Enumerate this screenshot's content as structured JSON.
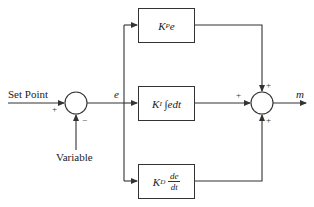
{
  "diagram": {
    "type": "PID controller block diagram",
    "inputs": {
      "set_point_label": "Set Point",
      "variable_label": "Variable"
    },
    "summing_junction_1": {
      "plus_sign": "+",
      "minus_sign": "−"
    },
    "error_label": "e",
    "blocks": [
      {
        "id": "proportional",
        "gain": "K",
        "subscript": "P",
        "expression": "e"
      },
      {
        "id": "integral",
        "gain": "K",
        "subscript": "I",
        "expression": "∫edt"
      },
      {
        "id": "derivative",
        "gain": "K",
        "subscript": "D",
        "numerator": "de",
        "denominator": "dt"
      }
    ],
    "summing_junction_2": {
      "top_sign": "+",
      "left_sign": "+",
      "bottom_sign": "+"
    },
    "output_label": "m"
  }
}
